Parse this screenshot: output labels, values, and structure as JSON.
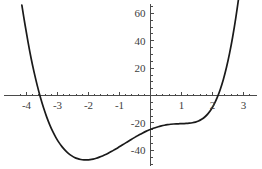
{
  "chart_data": {
    "type": "line",
    "title": "",
    "subtitle": "",
    "xlabel": "",
    "ylabel": "",
    "xlim": [
      -4.15,
      3.1
    ],
    "ylim": [
      -53,
      66
    ],
    "grid": false,
    "legend": null,
    "axis_style": "centered-cross",
    "xticks_major": [
      -4,
      -3,
      -2,
      -1,
      1,
      2,
      3
    ],
    "xtick_labels": [
      "-4",
      "-3",
      "-2",
      "-1",
      "1",
      "2",
      "3"
    ],
    "yticks_major": [
      -40,
      -20,
      20,
      40,
      60
    ],
    "ytick_labels": [
      "-40",
      "-20",
      "20",
      "40",
      "60"
    ],
    "xticks_minor_step": 0.2,
    "yticks_minor_step": 5,
    "series": [
      {
        "name": "quartic",
        "color": "#1a1a1a",
        "x": [
          -4.15,
          -4.05,
          -3.95,
          -3.85,
          -3.75,
          -3.65,
          -3.55,
          -3.45,
          -3.35,
          -3.25,
          -3.15,
          -3.05,
          -2.95,
          -2.85,
          -2.75,
          -2.65,
          -2.55,
          -2.45,
          -2.35,
          -2.25,
          -2.15,
          -2.05,
          -1.95,
          -1.85,
          -1.75,
          -1.65,
          -1.55,
          -1.45,
          -1.35,
          -1.25,
          -1.15,
          -1.05,
          -0.95,
          -0.85,
          -0.75,
          -0.65,
          -0.55,
          -0.45,
          -0.35,
          -0.25,
          -0.15,
          -0.05,
          0.05,
          0.15,
          0.25,
          0.35,
          0.45,
          0.55,
          0.65,
          0.75,
          0.85,
          0.95,
          1.05,
          1.15,
          1.25,
          1.35,
          1.45,
          1.55,
          1.65,
          1.75,
          1.85,
          1.95,
          2.05,
          2.15,
          2.25,
          2.35,
          2.45,
          2.55,
          2.65,
          2.75,
          2.85,
          2.95,
          3.05
        ],
        "y": [
          66.0,
          52.0,
          39.0,
          27.0,
          16.5,
          7.0,
          -1.5,
          -9.0,
          -15.6,
          -21.4,
          -26.4,
          -30.7,
          -34.4,
          -37.5,
          -40.1,
          -42.2,
          -43.9,
          -45.2,
          -46.1,
          -46.7,
          -47.0,
          -47.0,
          -46.8,
          -46.4,
          -45.8,
          -45.0,
          -44.1,
          -43.1,
          -41.9,
          -40.7,
          -39.4,
          -38.1,
          -36.7,
          -35.3,
          -33.9,
          -32.5,
          -31.1,
          -29.8,
          -28.5,
          -27.3,
          -26.2,
          -25.2,
          -24.3,
          -23.5,
          -22.8,
          -22.2,
          -21.7,
          -21.3,
          -21.0,
          -20.8,
          -20.7,
          -20.6,
          -20.5,
          -20.4,
          -20.2,
          -19.9,
          -19.4,
          -18.6,
          -17.4,
          -15.7,
          -13.4,
          -10.4,
          -6.5,
          -1.6,
          4.4,
          11.7,
          20.4,
          30.7,
          42.7,
          56.5,
          72.2,
          90.0,
          110.0
        ],
        "roots_approx": [
          -3.6,
          2.1
        ],
        "minimum": {
          "x": -2.2,
          "y": -47
        },
        "y_intercept": -20
      }
    ]
  },
  "axes": {
    "origin_label": "",
    "x_axis_name": "x-axis",
    "y_axis_name": "y-axis"
  }
}
